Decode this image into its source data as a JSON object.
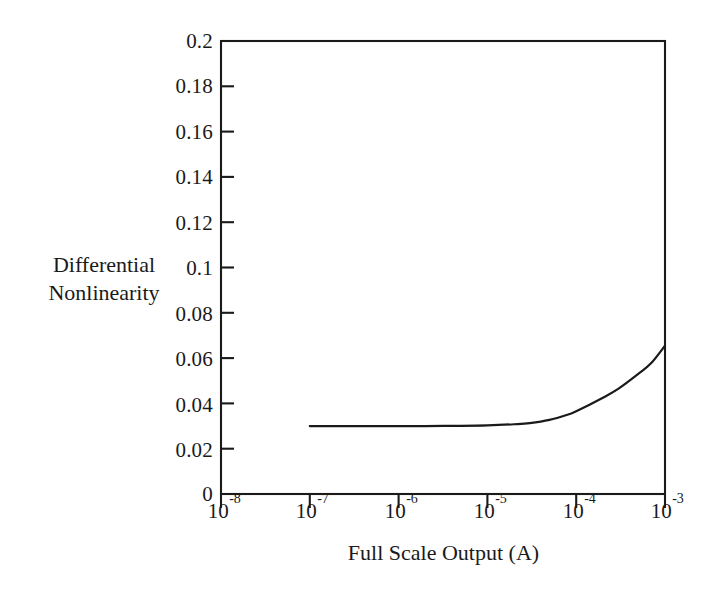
{
  "chart_data": {
    "type": "line",
    "title": "",
    "subtitle": "",
    "xlabel": "Full Scale Output (A)",
    "ylabel": "Differential Nonlinearity",
    "ylabel_lines": [
      "Differential",
      "Nonlinearity"
    ],
    "xscale": "log",
    "yscale": "linear",
    "xlim": [
      1e-08,
      0.001
    ],
    "ylim": [
      0,
      0.2
    ],
    "grid": false,
    "legend": null,
    "legend_position": "none",
    "annotations": [],
    "line_color": "#1a1a1a",
    "background_color": "#ffffff",
    "x_tick_values": [
      1e-08,
      1e-07,
      1e-06,
      1e-05,
      0.0001,
      0.001
    ],
    "x_tick_labels": [
      "10-8",
      "10-7",
      "10-6",
      "10-5",
      "10-4",
      "10-3"
    ],
    "x_tick_mantissas": [
      "10",
      "10",
      "10",
      "10",
      "10",
      "10"
    ],
    "x_tick_exponents": [
      "-8",
      "-7",
      "-6",
      "-5",
      "-4",
      "-3"
    ],
    "y_tick_values": [
      0,
      0.02,
      0.04,
      0.06,
      0.08,
      0.1,
      0.12,
      0.14,
      0.16,
      0.18,
      0.2
    ],
    "y_tick_labels": [
      "0",
      "0.02",
      "0.04",
      "0.06",
      "0.08",
      "0.1",
      "0.12",
      "0.14",
      "0.16",
      "0.18",
      "0.2"
    ],
    "series": [
      {
        "name": "Differential Nonlinearity",
        "x": [
          1e-07,
          2e-07,
          5e-07,
          1e-06,
          2e-06,
          5e-06,
          1e-05,
          2e-05,
          3e-05,
          5e-05,
          8e-05,
          0.0001,
          0.0002,
          0.0003,
          0.0005,
          0.0007,
          0.001
        ],
        "values": [
          0.03,
          0.03,
          0.03,
          0.03,
          0.03,
          0.0301,
          0.0303,
          0.0308,
          0.0313,
          0.0327,
          0.035,
          0.0365,
          0.0425,
          0.0465,
          0.053,
          0.0578,
          0.0655
        ]
      }
    ]
  },
  "axis": {
    "x_title": "Full Scale Output (A)",
    "y_title_line1": "Differential",
    "y_title_line2": "Nonlinearity"
  }
}
